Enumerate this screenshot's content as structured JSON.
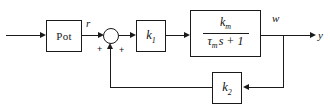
{
  "diagram": {
    "type": "control-system-block-diagram",
    "line_color": "#1a1a1a",
    "background_color": "#ffffff"
  },
  "blocks": {
    "pot": {
      "label": "Pot"
    },
    "gain1": {
      "base": "k",
      "subscript": "1"
    },
    "plant": {
      "numerator_base": "k",
      "numerator_subscript": "m",
      "denominator_tau": "τ",
      "denominator_subscript": "m",
      "denominator_rest": "s + 1"
    },
    "gain2": {
      "base": "k",
      "subscript": "2"
    }
  },
  "summing_junction": {
    "sign_left": "+",
    "sign_right": "+"
  },
  "signals": {
    "reference": "r",
    "speed": "w",
    "output": "y"
  }
}
